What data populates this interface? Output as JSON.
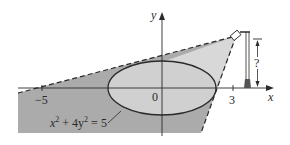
{
  "figure": {
    "axes": {
      "x_label": "x",
      "y_label": "y",
      "origin_label": "0",
      "ticks": [
        {
          "value": -5,
          "label": "−5"
        },
        {
          "value": 3,
          "label": "3"
        }
      ]
    },
    "ellipse": {
      "equation_label": "x² + 4y² = 5",
      "eq_lhs_x": "x",
      "eq_sup1": "2",
      "eq_mid": " + 4y",
      "eq_sup2": "2",
      "eq_rhs": " = 5"
    },
    "lamp": {
      "height_label": "?"
    },
    "colors": {
      "shadow": "#a9a9a9",
      "light_region": "#d6d6d6",
      "ellipse_fill": "#cfcfcf",
      "stroke": "#2a2a2a"
    }
  }
}
